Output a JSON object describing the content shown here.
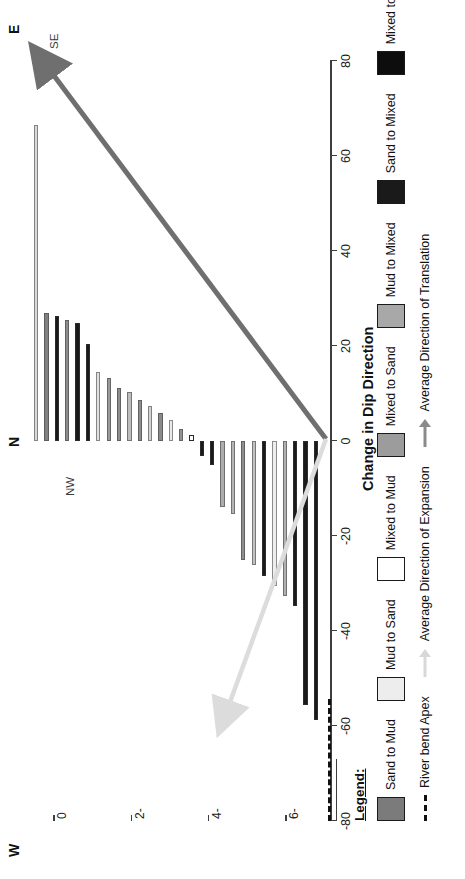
{
  "chart_data": {
    "type": "bar",
    "orientation": "horizontal",
    "title": "",
    "xlabel": "Change in Dip Direction",
    "ylabel": "",
    "xlim": [
      -80,
      80
    ],
    "ylim": [
      -7,
      0.5
    ],
    "grid": false,
    "xticks": [
      -80,
      -60,
      -40,
      -20,
      0,
      20,
      40,
      60,
      80
    ],
    "xticklabels": [
      "-80",
      "-60",
      "-40",
      "-20",
      "0",
      "20",
      "40",
      "60",
      "80"
    ],
    "yticks": [
      0,
      -2,
      -4,
      -6
    ],
    "yticklabels": [
      "0",
      "2-",
      "4-",
      "6-"
    ],
    "series_note": "Each bar is one facies transition; colour encodes transition class.",
    "bars": [
      {
        "index": 1,
        "value": 66.5,
        "class": "Mixed to Mixed",
        "color": "#d9d9d9"
      },
      {
        "index": 2,
        "value": 27.0,
        "class": "Mixed to Mixed",
        "color": "#808080"
      },
      {
        "index": 3,
        "value": 26.3,
        "class": "Mud to Mixed",
        "color": "#1a1a1a"
      },
      {
        "index": 4,
        "value": 25.5,
        "class": "Mixed to Mixed",
        "color": "#8c8c8c"
      },
      {
        "index": 5,
        "value": 24.8,
        "class": "Mud to Mixed",
        "color": "#1a1a1a"
      },
      {
        "index": 6,
        "value": 20.4,
        "class": "Mud to Mixed",
        "color": "#1a1a1a"
      },
      {
        "index": 7,
        "value": 14.6,
        "class": "Mixed to Mixed",
        "color": "#e0e0e0"
      },
      {
        "index": 8,
        "value": 13.3,
        "class": "Mixed to Sand",
        "color": "#9a9a9a"
      },
      {
        "index": 9,
        "value": 11.2,
        "class": "Mixed to Sand",
        "color": "#8f8f8f"
      },
      {
        "index": 10,
        "value": 10.4,
        "class": "Sand to Mixed",
        "color": "#bdbdbd"
      },
      {
        "index": 11,
        "value": 8.6,
        "class": "Mixed to Sand",
        "color": "#8f8f8f"
      },
      {
        "index": 12,
        "value": 7.4,
        "class": "Mixed to Mixed",
        "color": "#d4d4d4"
      },
      {
        "index": 13,
        "value": 5.9,
        "class": "Mixed to Sand",
        "color": "#8a8a8a"
      },
      {
        "index": 14,
        "value": 4.4,
        "class": "Mud to Sand",
        "color": "#e8e8e8"
      },
      {
        "index": 15,
        "value": 2.5,
        "class": "Mixed to Sand",
        "color": "#949494"
      },
      {
        "index": 16,
        "value": 1.2,
        "class": "Mixed to Mud",
        "color": "#ffffff"
      },
      {
        "index": 17,
        "value": -3.2,
        "class": "Mud to Mixed",
        "color": "#1a1a1a"
      },
      {
        "index": 18,
        "value": -5.1,
        "class": "Mud to Mixed",
        "color": "#1a1a1a"
      },
      {
        "index": 19,
        "value": -13.8,
        "class": "Mixed to Sand",
        "color": "#adadad"
      },
      {
        "index": 20,
        "value": -15.4,
        "class": "Mixed to Sand",
        "color": "#b5b5b5"
      },
      {
        "index": 21,
        "value": -25.1,
        "class": "Mixed to Sand",
        "color": "#8f8f8f"
      },
      {
        "index": 22,
        "value": -26.2,
        "class": "Mixed to Mixed",
        "color": "#c2c2c2"
      },
      {
        "index": 23,
        "value": -28.4,
        "class": "Mud to Mixed",
        "color": "#1a1a1a"
      },
      {
        "index": 24,
        "value": -30.5,
        "class": "Mixed to Mixed",
        "color": "#ededed"
      },
      {
        "index": 25,
        "value": -32.6,
        "class": "Mixed to Sand",
        "color": "#b0b0b0"
      },
      {
        "index": 26,
        "value": -34.8,
        "class": "Mud to Mixed",
        "color": "#1a1a1a"
      },
      {
        "index": 27,
        "value": -55.5,
        "class": "Mud to Mixed",
        "color": "#1a1a1a"
      },
      {
        "index": 28,
        "value": -58.8,
        "class": "Mud to Mixed",
        "color": "#1a1a1a"
      }
    ],
    "annotations": [
      {
        "name": "river-bend-apex-line",
        "value": 0,
        "style": "dashed",
        "color": "#111111"
      },
      {
        "name": "average-direction-of-translation",
        "label": "SE",
        "color": "#6f6f6f"
      },
      {
        "name": "average-direction-of-expansion",
        "label": "NW",
        "color": "#d8d8d8"
      }
    ]
  },
  "compass": {
    "east": "E",
    "north": "N",
    "west": "W",
    "southeast": "SE",
    "northwest": "NW"
  },
  "axis": {
    "value_title": "Change in Dip Direction",
    "value_ticks": [
      "-80",
      "-60",
      "-40",
      "-20",
      "0",
      "20",
      "40",
      "60",
      "80"
    ],
    "category_ticks": [
      "0",
      "2-",
      "4-",
      "6-"
    ]
  },
  "legend": {
    "title": "Legend:",
    "row1": [
      {
        "label": "Sand to Mud",
        "color": "#7b7b7b",
        "icon": "legend-swatch"
      },
      {
        "label": "Mud to Sand",
        "color": "#ededed",
        "icon": "legend-swatch"
      },
      {
        "label": "Mixed to Mud",
        "color": "#ffffff",
        "icon": "legend-swatch"
      },
      {
        "label": "Mixed to Sand",
        "color": "#9c9c9c",
        "icon": "legend-swatch"
      },
      {
        "label": "Mud to Mixed",
        "color": "#a8a8a8",
        "icon": "legend-swatch"
      },
      {
        "label": "Sand to Mixed",
        "color": "#1a1a1a",
        "icon": "legend-swatch"
      },
      {
        "label": "Mixed to Mixed",
        "color": "#0d0d0d",
        "icon": "legend-swatch"
      }
    ],
    "row2": [
      {
        "label": "River bend Apex",
        "icon": "dashed-line-icon",
        "color": "#111111"
      },
      {
        "label": "Average Direction of Expansion",
        "icon": "arrow-up-icon",
        "color": "#d8d8d8"
      },
      {
        "label": "Average Direction of Translation",
        "icon": "arrow-up-icon",
        "color": "#8a8a8a"
      }
    ]
  }
}
